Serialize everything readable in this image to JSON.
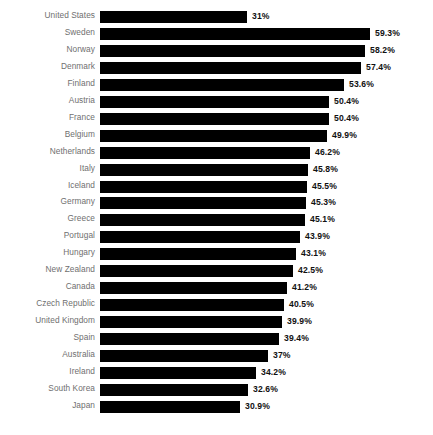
{
  "chart_data": {
    "type": "bar",
    "orientation": "horizontal",
    "title": "",
    "subtitle": "",
    "xlabel": "",
    "ylabel": "",
    "xlim": [
      0,
      59.3
    ],
    "grid": false,
    "legend": false,
    "bar_color": "#000000",
    "category_label_color": "#6f6f6f",
    "value_label_color": "#111111",
    "background_color": "#ffffff",
    "value_suffix": "%",
    "categories": [
      "United States",
      "Sweden",
      "Norway",
      "Denmark",
      "Finland",
      "Austria",
      "France",
      "Belgium",
      "Netherlands",
      "Italy",
      "Iceland",
      "Germany",
      "Greece",
      "Portugal",
      "Hungary",
      "New Zealand",
      "Canada",
      "Czech Republic",
      "United Kingdom",
      "Spain",
      "Australia",
      "Ireland",
      "South Korea",
      "Japan"
    ],
    "values": [
      31,
      59.3,
      58.2,
      57.4,
      53.6,
      50.4,
      50.4,
      49.9,
      46.2,
      45.8,
      45.5,
      45.3,
      45.1,
      43.9,
      43.1,
      42.5,
      41.2,
      40.5,
      39.9,
      39.4,
      37,
      34.2,
      32.6,
      30.9
    ],
    "value_labels": [
      "31%",
      "59.3%",
      "58.2%",
      "57.4%",
      "53.6%",
      "50.4%",
      "50.4%",
      "49.9%",
      "46.2%",
      "45.8%",
      "45.5%",
      "45.3%",
      "45.1%",
      "43.9%",
      "43.1%",
      "42.5%",
      "41.2%",
      "40.5%",
      "39.9%",
      "39.4%",
      "37%",
      "34.2%",
      "32.6%",
      "30.9%"
    ],
    "bar_pixel_widths": [
      147,
      270,
      265,
      261,
      244,
      229,
      229,
      227,
      210,
      208,
      207,
      206,
      205,
      200,
      196,
      193,
      187,
      184,
      182,
      179,
      168,
      156,
      148,
      140
    ]
  },
  "layout": {
    "bar_start_x": 100,
    "bar_height": 12,
    "row_spacing": 16.95,
    "first_row_y": 11
  }
}
